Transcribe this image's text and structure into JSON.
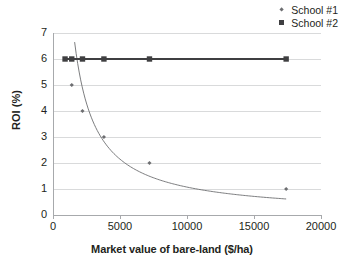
{
  "chart_data": {
    "type": "scatter",
    "title": "",
    "xlabel": "Market value of bare-land ($/ha)",
    "ylabel": "ROI (%)",
    "xlim": [
      0,
      20000
    ],
    "ylim": [
      0,
      7
    ],
    "xticks": [
      0,
      5000,
      10000,
      15000,
      20000
    ],
    "yticks": [
      0,
      1,
      2,
      3,
      4,
      5,
      6,
      7
    ],
    "xtick_labels": [
      "0",
      "5000",
      "10000",
      "15000",
      "20000"
    ],
    "ytick_labels": [
      "0",
      "1",
      "2",
      "3",
      "4",
      "5",
      "6",
      "7"
    ],
    "grid": "horizontal",
    "legend_position": "top-right",
    "series": [
      {
        "name": "School #1",
        "marker": "diamond",
        "color": "#6d6e71",
        "points": [
          {
            "x": 900,
            "y": 6
          },
          {
            "x": 1400,
            "y": 5
          },
          {
            "x": 2200,
            "y": 4
          },
          {
            "x": 3800,
            "y": 3
          },
          {
            "x": 7200,
            "y": 2
          },
          {
            "x": 17400,
            "y": 1
          }
        ]
      },
      {
        "name": "School #2",
        "marker": "square",
        "color": "#3f3f41",
        "points": [
          {
            "x": 900,
            "y": 6
          },
          {
            "x": 1400,
            "y": 6
          },
          {
            "x": 2200,
            "y": 6
          },
          {
            "x": 3800,
            "y": 6
          },
          {
            "x": 7200,
            "y": 6
          },
          {
            "x": 17400,
            "y": 6
          }
        ]
      }
    ]
  },
  "legend": {
    "items": [
      {
        "label": "School #1",
        "marker": "diamond"
      },
      {
        "label": "School #2",
        "marker": "square"
      }
    ]
  },
  "axes": {
    "x_title": "Market value of bare-land ($/ha)",
    "y_title": "ROI (%)"
  }
}
